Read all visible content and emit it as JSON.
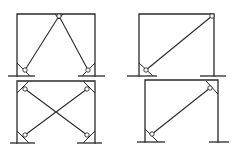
{
  "diagram": {
    "line_color": "#2a2a2a",
    "background": "#ffffff",
    "panels": [
      {
        "id": "chevron-brace",
        "frame": {
          "x1": 17,
          "x2": 95,
          "top": 14,
          "base": 76
        },
        "grounds": [
          [
            8,
            35
          ],
          [
            78,
            105
          ]
        ],
        "braces": [
          [
            25,
            70,
            59,
            16
          ],
          [
            59,
            16,
            88,
            70
          ]
        ],
        "pins": [
          [
            59,
            16
          ],
          [
            25,
            70
          ],
          [
            88,
            70
          ]
        ],
        "gussets": [
          [
            17,
            63,
            30,
            76
          ],
          [
            95,
            63,
            82,
            76
          ]
        ],
        "apex_gusset": [
          [
            55,
            14,
            59,
            19,
            63,
            14
          ]
        ]
      },
      {
        "id": "single-diagonal-brace",
        "frame": {
          "x1": 139,
          "x2": 214,
          "top": 14,
          "base": 76
        },
        "grounds": [
          [
            127,
            157
          ],
          [
            200,
            226
          ]
        ],
        "braces": [
          [
            146,
            70,
            212,
            16
          ]
        ],
        "pins": [
          [
            212,
            16
          ],
          [
            146,
            70
          ]
        ],
        "gussets": [
          [
            139,
            63,
            153,
            76
          ]
        ],
        "apex_gusset": []
      },
      {
        "id": "x-brace",
        "frame": {
          "x1": 17,
          "x2": 95,
          "top": 81,
          "base": 143
        },
        "grounds": [
          [
            10,
            35
          ],
          [
            77,
            102
          ]
        ],
        "braces": [
          [
            25,
            89,
            87,
            135
          ],
          [
            87,
            89,
            25,
            135
          ]
        ],
        "pins": [
          [
            25,
            89
          ],
          [
            87,
            89
          ],
          [
            25,
            135
          ],
          [
            87,
            135
          ]
        ],
        "gussets": [
          [
            17,
            131,
            29,
            143
          ],
          [
            95,
            131,
            83,
            143
          ],
          [
            17,
            93,
            29,
            81
          ],
          [
            95,
            93,
            83,
            81
          ]
        ],
        "apex_gusset": []
      },
      {
        "id": "single-diagonal-brace-fixed",
        "frame": {
          "x1": 145,
          "x2": 218,
          "top": 80,
          "base": 142
        },
        "grounds": [
          [
            137,
            165
          ],
          [
            209,
            229
          ]
        ],
        "braces": [
          [
            152,
            134,
            210,
            88
          ]
        ],
        "pins": [
          [
            210,
            88
          ],
          [
            152,
            134
          ]
        ],
        "gussets": [
          [
            145,
            129,
            158,
            142
          ],
          [
            218,
            94,
            206,
            81
          ]
        ],
        "apex_gusset": []
      }
    ]
  }
}
